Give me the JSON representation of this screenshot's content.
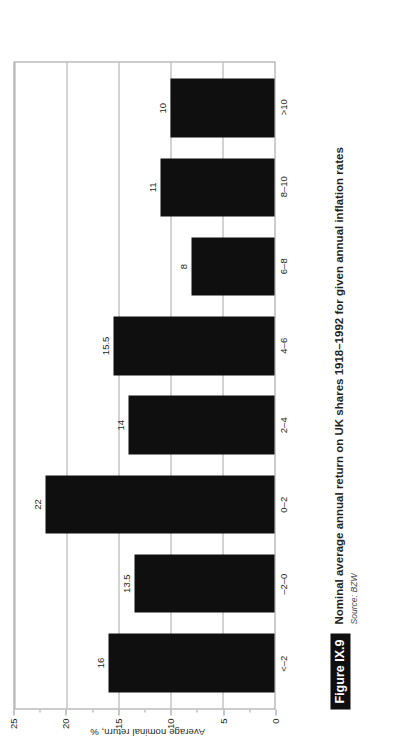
{
  "figure": {
    "badge": "Figure IX.9",
    "title": "Nominal average annual return on UK shares 1918–1992 for given annual inflation rates",
    "source": "Source: BZW"
  },
  "colors": {
    "bar": "#100f0f",
    "grid": "#a8a8a8",
    "frame": "#9a9a9a",
    "text": "#231f20",
    "badge_background": "#100f0f",
    "badge_text": "#ffffff"
  },
  "chart_data": {
    "type": "bar",
    "title": "Nominal average annual return on UK shares 1918–1992 for given annual inflation rates",
    "subtitle": "",
    "xlabel": "",
    "ylabel": "Average nominal return, %",
    "categories": [
      "<–2",
      "–2–0",
      "0–2",
      "2–4",
      "4–6",
      "6–8",
      "8–10",
      ">10"
    ],
    "values": [
      16,
      13.5,
      22,
      14,
      15.5,
      8,
      11,
      10
    ],
    "value_labels": [
      "16",
      "13.5",
      "22",
      "14",
      "15.5",
      "8",
      "11",
      "10"
    ],
    "ylim": [
      0,
      25
    ],
    "yticks": [
      0,
      5,
      10,
      15,
      20,
      25
    ],
    "ytick_labels": [
      "0",
      "5",
      "10",
      "15",
      "20",
      "25"
    ],
    "yminor_ticks": [
      2.5,
      7.5,
      12.5,
      17.5,
      22.5
    ],
    "grid": true,
    "grid_axis": "y",
    "legend": false,
    "legend_position": "none",
    "orientation": "vertical",
    "page_rotation_degrees": -90
  }
}
